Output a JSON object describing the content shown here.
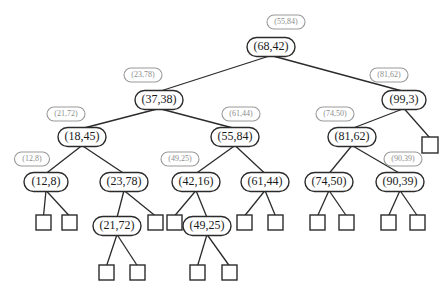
{
  "figure": {
    "title": "",
    "kind": "binary-search-tree-diagram",
    "colors": {
      "node_stroke": "#2b2b2b",
      "node_fill": "#ffffff",
      "ghost_stroke": "#9a9a9a",
      "ghost_text": "#8d8d8d",
      "edge": "#2b2b2b",
      "background": "#ffffff"
    }
  },
  "nodes": [
    {
      "id": "n0",
      "label": "(68,42)",
      "x": 271,
      "y": 47,
      "w": 48,
      "h": 19,
      "level": 1
    },
    {
      "id": "n1",
      "label": "(37,38)",
      "x": 159,
      "y": 100,
      "w": 48,
      "h": 19,
      "level": 2
    },
    {
      "id": "n2",
      "label": "(99,3)",
      "x": 404,
      "y": 100,
      "w": 44,
      "h": 19,
      "level": 2
    },
    {
      "id": "n3",
      "label": "(18,45)",
      "x": 82,
      "y": 137,
      "w": 48,
      "h": 19,
      "level": 3
    },
    {
      "id": "n4",
      "label": "(55,84)",
      "x": 235,
      "y": 137,
      "w": 48,
      "h": 19,
      "level": 3
    },
    {
      "id": "n5",
      "label": "(81,62)",
      "x": 352,
      "y": 137,
      "w": 48,
      "h": 19,
      "level": 3
    },
    {
      "id": "n6",
      "label": "(12,8)",
      "x": 46,
      "y": 182,
      "w": 44,
      "h": 19,
      "level": 4
    },
    {
      "id": "n7",
      "label": "(23,78)",
      "x": 124,
      "y": 182,
      "w": 48,
      "h": 19,
      "level": 4
    },
    {
      "id": "n8",
      "label": "(42,16)",
      "x": 196,
      "y": 182,
      "w": 48,
      "h": 19,
      "level": 4
    },
    {
      "id": "n9",
      "label": "(61,44)",
      "x": 265,
      "y": 182,
      "w": 48,
      "h": 19,
      "level": 4
    },
    {
      "id": "n10",
      "label": "(74,50)",
      "x": 329,
      "y": 182,
      "w": 48,
      "h": 19,
      "level": 4
    },
    {
      "id": "n11",
      "label": "(90,39)",
      "x": 400,
      "y": 182,
      "w": 48,
      "h": 19,
      "level": 4
    },
    {
      "id": "n12",
      "label": "(21,72)",
      "x": 117,
      "y": 226,
      "w": 48,
      "h": 19,
      "level": 5
    },
    {
      "id": "n13",
      "label": "(49,25)",
      "x": 207,
      "y": 226,
      "w": 48,
      "h": 19,
      "level": 5
    }
  ],
  "ghost_labels": [
    {
      "id": "g0",
      "label": "(55,84)",
      "x": 286,
      "y": 22,
      "w": 38,
      "h": 14,
      "for": "n0"
    },
    {
      "id": "g1",
      "label": "(23,78)",
      "x": 143,
      "y": 75,
      "w": 38,
      "h": 14,
      "for": "n1"
    },
    {
      "id": "g2",
      "label": "(81,62)",
      "x": 389,
      "y": 75,
      "w": 38,
      "h": 14,
      "for": "n2"
    },
    {
      "id": "g3",
      "label": "(21,72)",
      "x": 66,
      "y": 114,
      "w": 38,
      "h": 14,
      "for": "n3"
    },
    {
      "id": "g4",
      "label": "(61,44)",
      "x": 241,
      "y": 114,
      "w": 38,
      "h": 14,
      "for": "n4"
    },
    {
      "id": "g5",
      "label": "(74,50)",
      "x": 335,
      "y": 114,
      "w": 38,
      "h": 14,
      "for": "n5"
    },
    {
      "id": "g6",
      "label": "(12,8)",
      "x": 32,
      "y": 159,
      "w": 35,
      "h": 14,
      "for": "n6"
    },
    {
      "id": "g7",
      "label": "(49,25)",
      "x": 180,
      "y": 159,
      "w": 38,
      "h": 14,
      "for": "n8"
    },
    {
      "id": "g8",
      "label": "(90,39)",
      "x": 403,
      "y": 159,
      "w": 38,
      "h": 14,
      "for": "n11"
    }
  ],
  "leaves": [
    {
      "id": "L0",
      "x": 422,
      "y": 137,
      "size": 16,
      "parent": "n2"
    },
    {
      "id": "L1",
      "x": 36,
      "y": 215,
      "size": 15,
      "parent": "n6"
    },
    {
      "id": "L2",
      "x": 62,
      "y": 215,
      "size": 15,
      "parent": "n6"
    },
    {
      "id": "L3",
      "x": 148,
      "y": 215,
      "size": 15,
      "parent": "n7"
    },
    {
      "id": "L4",
      "x": 167,
      "y": 215,
      "size": 15,
      "parent": "n8"
    },
    {
      "id": "L5",
      "x": 237,
      "y": 215,
      "size": 15,
      "parent": "n9"
    },
    {
      "id": "L6",
      "x": 268,
      "y": 215,
      "size": 15,
      "parent": "n9"
    },
    {
      "id": "L7",
      "x": 310,
      "y": 215,
      "size": 15,
      "parent": "n10"
    },
    {
      "id": "L8",
      "x": 339,
      "y": 215,
      "size": 15,
      "parent": "n10"
    },
    {
      "id": "L9",
      "x": 381,
      "y": 215,
      "size": 15,
      "parent": "n11"
    },
    {
      "id": "L10",
      "x": 410,
      "y": 215,
      "size": 15,
      "parent": "n11"
    },
    {
      "id": "L11",
      "x": 99,
      "y": 265,
      "size": 15,
      "parent": "n12"
    },
    {
      "id": "L12",
      "x": 130,
      "y": 265,
      "size": 15,
      "parent": "n12"
    },
    {
      "id": "L13",
      "x": 190,
      "y": 265,
      "size": 15,
      "parent": "n13"
    },
    {
      "id": "L14",
      "x": 222,
      "y": 265,
      "size": 15,
      "parent": "n13"
    }
  ],
  "edges": [
    {
      "from": "n0",
      "to": "n1"
    },
    {
      "from": "n0",
      "to": "n2"
    },
    {
      "from": "n1",
      "to": "n3"
    },
    {
      "from": "n1",
      "to": "n4"
    },
    {
      "from": "n2",
      "to": "n5"
    },
    {
      "from": "n2",
      "to": "L0"
    },
    {
      "from": "n3",
      "to": "n6"
    },
    {
      "from": "n3",
      "to": "n7"
    },
    {
      "from": "n4",
      "to": "n8"
    },
    {
      "from": "n4",
      "to": "n9"
    },
    {
      "from": "n5",
      "to": "n10"
    },
    {
      "from": "n5",
      "to": "n11"
    },
    {
      "from": "n6",
      "to": "L1"
    },
    {
      "from": "n6",
      "to": "L2"
    },
    {
      "from": "n7",
      "to": "n12"
    },
    {
      "from": "n7",
      "to": "L3"
    },
    {
      "from": "n8",
      "to": "L4"
    },
    {
      "from": "n8",
      "to": "n13"
    },
    {
      "from": "n9",
      "to": "L5"
    },
    {
      "from": "n9",
      "to": "L6"
    },
    {
      "from": "n10",
      "to": "L7"
    },
    {
      "from": "n10",
      "to": "L8"
    },
    {
      "from": "n11",
      "to": "L9"
    },
    {
      "from": "n11",
      "to": "L10"
    },
    {
      "from": "n12",
      "to": "L11"
    },
    {
      "from": "n12",
      "to": "L12"
    },
    {
      "from": "n13",
      "to": "L13"
    },
    {
      "from": "n13",
      "to": "L14"
    }
  ]
}
